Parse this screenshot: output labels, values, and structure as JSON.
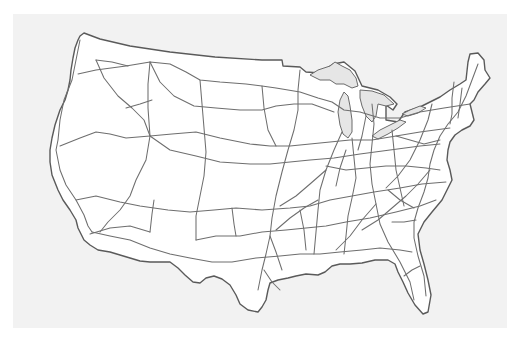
{
  "map": {
    "subject": "Contiguous United States interstate highway network",
    "style": "line drawing",
    "colors": {
      "background": "#ffffff",
      "paper": "#f2f2f2",
      "land": "#ffffff",
      "outline": "#5a5a5a",
      "lakes": "#e6e6e6",
      "highways": "#6e6e6e"
    },
    "features": [
      "country-outline",
      "great-lakes",
      "interstate-highways"
    ]
  }
}
